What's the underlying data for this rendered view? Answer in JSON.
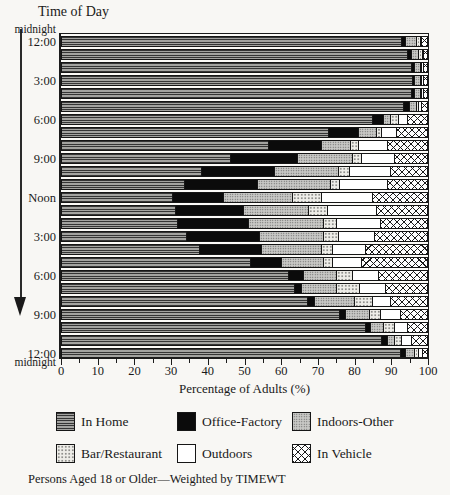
{
  "figure": {
    "y_axis_title": "Time of Day",
    "x_axis_title": "Percentage of Adults (%)",
    "top_axis_annotation": "midnight",
    "bottom_axis_annotation": "midnight",
    "footnote": "Persons Aged 18 or Older—Weighted by TIMEWT"
  },
  "colors": {
    "paper": "#f8f7f4",
    "ink": "#1a1a1a",
    "office_factory_fill": "#0b0b0b",
    "in_home_fill": "#8f8f8f",
    "indoors_other_fill": "#c9c9c6",
    "bar_restaurant_fill": "#eeede8",
    "outdoors_fill": "#ffffff",
    "in_vehicle_fill": "#ffffff"
  },
  "legend": {
    "items": [
      {
        "label": "In Home",
        "pattern": "in-home"
      },
      {
        "label": "Office-Factory",
        "pattern": "office-factory"
      },
      {
        "label": "Indoors-Other",
        "pattern": "indoors-other"
      },
      {
        "label": "Bar/Restaurant",
        "pattern": "bar-restaurant"
      },
      {
        "label": "Outdoors",
        "pattern": "outdoors"
      },
      {
        "label": "In Vehicle",
        "pattern": "in-vehicle"
      }
    ]
  },
  "chart_data": {
    "type": "bar",
    "subtype": "horizontal-stacked",
    "title": "",
    "xlabel": "Percentage of Adults (%)",
    "ylabel": "Time of Day",
    "xlim": [
      0,
      100
    ],
    "x_major_ticks": [
      0,
      10,
      20,
      30,
      40,
      50,
      60,
      70,
      80,
      90,
      100
    ],
    "x_minor_tick_step": 5,
    "grid": false,
    "legend_position": "below",
    "y_tick_rows": [
      0,
      3,
      6,
      9,
      12,
      15,
      18,
      21,
      24
    ],
    "y_tick_labels": [
      "12:00",
      "3:00",
      "6:00",
      "9:00",
      "Noon",
      "3:00",
      "6:00",
      "9:00",
      "12:00"
    ],
    "y_axis_note": "bars run hourly from midnight (top) to midnight (bottom), arrow indicates time flowing downward",
    "series_names": [
      "In Home",
      "Office-Factory",
      "Indoors-Other",
      "Bar/Restaurant",
      "Outdoors",
      "In Vehicle"
    ],
    "rows": [
      {
        "hour_index": 0,
        "values": [
          93,
          1,
          3,
          1,
          0.5,
          1.5
        ]
      },
      {
        "hour_index": 1,
        "values": [
          94.5,
          1,
          2,
          1,
          0.5,
          1
        ]
      },
      {
        "hour_index": 2,
        "values": [
          95.5,
          1,
          1.5,
          0.5,
          0.5,
          1
        ]
      },
      {
        "hour_index": 3,
        "values": [
          96,
          0.5,
          1.5,
          0.5,
          0.5,
          1
        ]
      },
      {
        "hour_index": 4,
        "values": [
          95.5,
          1,
          1.5,
          0.5,
          0.5,
          1
        ]
      },
      {
        "hour_index": 5,
        "values": [
          93.5,
          1.5,
          2,
          0.5,
          1,
          1.5
        ]
      },
      {
        "hour_index": 6,
        "values": [
          85,
          3,
          2,
          2,
          2.5,
          5.5
        ]
      },
      {
        "hour_index": 7,
        "values": [
          73,
          8,
          5,
          1.5,
          4,
          8.5
        ]
      },
      {
        "hour_index": 8,
        "values": [
          56.5,
          14.5,
          8,
          2,
          8,
          11
        ]
      },
      {
        "hour_index": 9,
        "values": [
          46,
          18.5,
          15,
          2.5,
          9,
          9
        ]
      },
      {
        "hour_index": 10,
        "values": [
          38,
          20,
          17.5,
          3,
          11.5,
          10
        ]
      },
      {
        "hour_index": 11,
        "values": [
          33.5,
          20,
          20,
          2.5,
          13,
          11
        ]
      },
      {
        "hour_index": 12,
        "values": [
          30,
          14,
          19,
          8,
          14,
          15
        ]
      },
      {
        "hour_index": 13,
        "values": [
          31,
          18.5,
          18,
          5,
          13.5,
          14
        ]
      },
      {
        "hour_index": 14,
        "values": [
          31.5,
          19.5,
          20.5,
          3.5,
          12,
          13
        ]
      },
      {
        "hour_index": 15,
        "values": [
          34,
          20,
          17.5,
          4,
          10,
          14.5
        ]
      },
      {
        "hour_index": 16,
        "values": [
          37.5,
          17,
          16.5,
          3,
          9,
          17
        ]
      },
      {
        "hour_index": 17,
        "values": [
          51.5,
          8.5,
          11.5,
          2.5,
          8,
          18
        ]
      },
      {
        "hour_index": 18,
        "values": [
          62,
          4,
          9,
          4.5,
          7,
          13.5
        ]
      },
      {
        "hour_index": 19,
        "values": [
          63.5,
          2,
          9.5,
          6.5,
          7,
          11.5
        ]
      },
      {
        "hour_index": 20,
        "values": [
          67,
          2,
          11,
          5,
          5,
          10
        ]
      },
      {
        "hour_index": 21,
        "values": [
          76,
          1.5,
          6.5,
          3,
          5.5,
          7.5
        ]
      },
      {
        "hour_index": 22,
        "values": [
          83,
          1.5,
          3.5,
          3,
          3.5,
          5.5
        ]
      },
      {
        "hour_index": 23,
        "values": [
          87.5,
          1.5,
          2,
          2,
          2.5,
          4.5
        ]
      },
      {
        "hour_index": 24,
        "values": [
          92.5,
          1.5,
          2.5,
          1,
          1,
          1.5
        ]
      }
    ]
  }
}
